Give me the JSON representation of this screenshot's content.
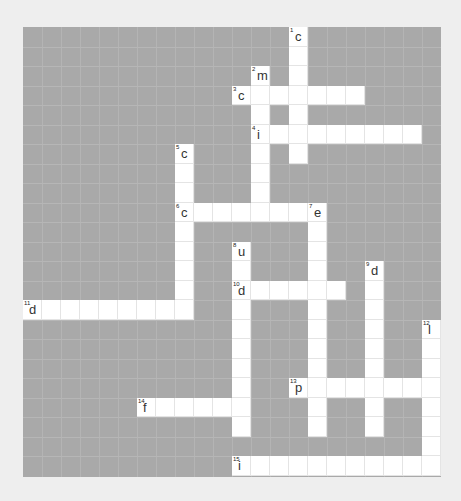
{
  "puzzle": {
    "cols": 22,
    "rows": 23,
    "colors": {
      "page_bg": "#eeeeee",
      "block": "#a9a9a9",
      "cell": "#ffffff"
    },
    "entries": [
      {
        "number": "1",
        "direction": "down",
        "col": 14,
        "row": 0,
        "length": 7,
        "first_letter": "c"
      },
      {
        "number": "2",
        "direction": "down",
        "col": 12,
        "row": 2,
        "length": 8,
        "first_letter": "m"
      },
      {
        "number": "3",
        "direction": "across",
        "col": 11,
        "row": 3,
        "length": 7,
        "first_letter": "c"
      },
      {
        "number": "4",
        "direction": "across",
        "col": 12,
        "row": 5,
        "length": 9,
        "first_letter": "i"
      },
      {
        "number": "5",
        "direction": "down",
        "col": 8,
        "row": 6,
        "length": 9,
        "first_letter": "c"
      },
      {
        "number": "6",
        "direction": "across",
        "col": 8,
        "row": 9,
        "length": 8,
        "first_letter": "c"
      },
      {
        "number": "7",
        "direction": "down",
        "col": 15,
        "row": 9,
        "length": 12,
        "first_letter": "e"
      },
      {
        "number": "8",
        "direction": "down",
        "col": 11,
        "row": 11,
        "length": 10,
        "first_letter": "u"
      },
      {
        "number": "9",
        "direction": "down",
        "col": 18,
        "row": 12,
        "length": 9,
        "first_letter": "d"
      },
      {
        "number": "10",
        "direction": "across",
        "col": 11,
        "row": 13,
        "length": 6,
        "first_letter": "d"
      },
      {
        "number": "11",
        "direction": "across",
        "col": 0,
        "row": 14,
        "length": 9,
        "first_letter": "d"
      },
      {
        "number": "12",
        "direction": "down",
        "col": 21,
        "row": 15,
        "length": 8,
        "first_letter": "l"
      },
      {
        "number": "13",
        "direction": "across",
        "col": 14,
        "row": 18,
        "length": 8,
        "first_letter": "p"
      },
      {
        "number": "14",
        "direction": "across",
        "col": 6,
        "row": 19,
        "length": 6,
        "first_letter": "f"
      },
      {
        "number": "15",
        "direction": "across",
        "col": 11,
        "row": 22,
        "length": 11,
        "first_letter": "i"
      }
    ]
  }
}
